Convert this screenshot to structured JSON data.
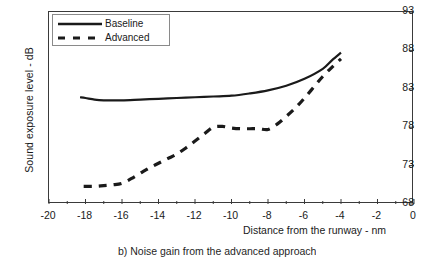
{
  "chart_data": {
    "type": "line",
    "title": "",
    "xlabel": "Distance from the runway - nm",
    "ylabel": "Sound exposure level - dB",
    "xlim": [
      -20,
      0
    ],
    "ylim": [
      68,
      93
    ],
    "xticks": [
      -20,
      -18,
      -16,
      -14,
      -12,
      -10,
      -8,
      -6,
      -4,
      -2,
      0
    ],
    "yticks": [
      68,
      73,
      78,
      83,
      88,
      93
    ],
    "xtick_labels": [
      "-20",
      "-18",
      "-16",
      "-14",
      "-12",
      "-10",
      "-8",
      "-6",
      "-4",
      "-2",
      "0"
    ],
    "ytick_labels": [
      "68",
      "73",
      "78",
      "83",
      "88",
      "93"
    ],
    "y_axis_position": "right",
    "grid": false,
    "legend_position": "top-left",
    "series": [
      {
        "name": "Baseline",
        "style": "solid",
        "color": "#1a1a1a",
        "x": [
          -18.3,
          -18.0,
          -17.5,
          -17.0,
          -16.5,
          -16.0,
          -15.0,
          -14.0,
          -13.0,
          -12.0,
          -11.0,
          -10.0,
          -9.0,
          -8.0,
          -7.0,
          -6.0,
          -5.0,
          -4.5,
          -4.0
        ],
        "y": [
          81.9,
          81.8,
          81.6,
          81.5,
          81.5,
          81.5,
          81.6,
          81.7,
          81.8,
          81.9,
          82.0,
          82.1,
          82.4,
          82.8,
          83.4,
          84.3,
          85.6,
          86.7,
          87.7
        ]
      },
      {
        "name": "Advanced",
        "style": "dashed",
        "color": "#1a1a1a",
        "x": [
          -18.1,
          -17.5,
          -17.0,
          -16.5,
          -16.0,
          -15.5,
          -15.0,
          -14.5,
          -14.0,
          -13.5,
          -13.0,
          -12.5,
          -12.0,
          -11.5,
          -11.0,
          -10.5,
          -10.0,
          -9.5,
          -9.0,
          -8.5,
          -8.0,
          -7.5,
          -7.0,
          -6.5,
          -6.0,
          -5.5,
          -5.0,
          -4.5,
          -4.0
        ],
        "y": [
          70.3,
          70.3,
          70.4,
          70.5,
          70.7,
          71.3,
          72.0,
          72.7,
          73.3,
          73.9,
          74.5,
          75.3,
          76.2,
          77.1,
          78.0,
          78.1,
          77.9,
          77.8,
          77.8,
          77.8,
          77.7,
          78.4,
          79.4,
          80.5,
          81.8,
          83.2,
          84.6,
          85.8,
          86.9
        ]
      }
    ]
  },
  "legend": {
    "items": [
      {
        "label": "Baseline",
        "style": "solid"
      },
      {
        "label": "Advanced",
        "style": "dashed"
      }
    ]
  },
  "caption": {
    "text": "b) Noise gain from the advanced approach"
  }
}
